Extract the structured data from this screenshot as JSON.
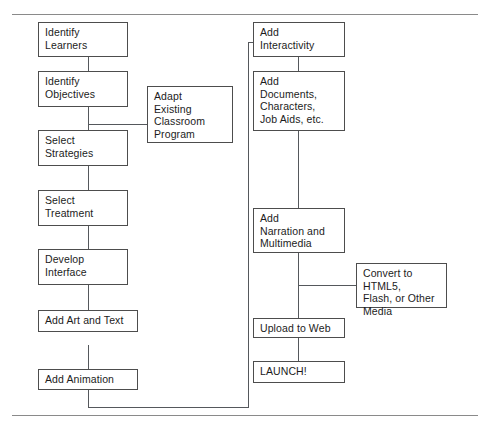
{
  "diagram": {
    "type": "flowchart",
    "line_color": "#55585c",
    "box_border_color": "#4d4d4d",
    "background": "#ffffff",
    "left_column": [
      {
        "id": "identify-learners",
        "label": "Identify\nLearners"
      },
      {
        "id": "identify-objectives",
        "label": "Identify\nObjectives"
      },
      {
        "id": "select-strategies",
        "label": "Select\nStrategies"
      },
      {
        "id": "select-treatment",
        "label": "Select\nTreatment"
      },
      {
        "id": "develop-interface",
        "label": "Develop\nInterface"
      },
      {
        "id": "add-art-and-text",
        "label": "Add Art and Text"
      },
      {
        "id": "add-animation",
        "label": "Add Animation"
      }
    ],
    "side_notes": [
      {
        "id": "adapt-existing-classroom-program",
        "label": "Adapt\nExisting\nClassroom\nProgram"
      },
      {
        "id": "convert-to-html5-flash-or-other-media",
        "label": "Convert to HTML5,\nFlash, or Other\nMedia"
      }
    ],
    "right_column": [
      {
        "id": "add-interactivity",
        "label": "Add\nInteractivity"
      },
      {
        "id": "add-documents-characters-job-aids",
        "label": "Add\nDocuments,\nCharacters,\nJob Aids, etc."
      },
      {
        "id": "add-narration-and-multimedia",
        "label": "Add\nNarration and\nMultimedia"
      },
      {
        "id": "upload-to-web",
        "label": "Upload to Web"
      },
      {
        "id": "launch",
        "label": "LAUNCH!"
      }
    ]
  }
}
